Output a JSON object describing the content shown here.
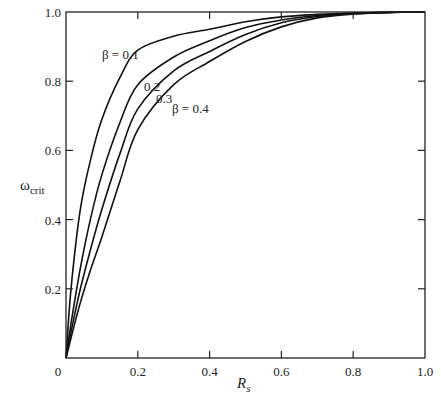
{
  "chart_data": {
    "type": "line",
    "title": "",
    "xlabel": "R_s",
    "ylabel": "ω_crit",
    "xlim": [
      0,
      1.0
    ],
    "ylim": [
      0,
      1.0
    ],
    "grid": false,
    "legend": "inline labels on curves",
    "x_ticks": [
      "0",
      "0.2",
      "0.4",
      "0.6",
      "0.8",
      "1.0"
    ],
    "y_ticks": [
      "0.2",
      "0.4",
      "0.6",
      "0.8",
      "1.0"
    ],
    "x": [
      0,
      0.014,
      0.04,
      0.07,
      0.1,
      0.15,
      0.2,
      0.3,
      0.4,
      0.5,
      0.6,
      0.7,
      0.8,
      0.9,
      1.0
    ],
    "series": [
      {
        "name": "β = 0.1",
        "label": "β = 0.1",
        "values": [
          0,
          0.2,
          0.43,
          0.58,
          0.69,
          0.81,
          0.89,
          0.93,
          0.95,
          0.972,
          0.986,
          0.993,
          0.997,
          0.999,
          1.0
        ]
      },
      {
        "name": "β = 0.2",
        "label": "0.2",
        "values": [
          0,
          0.1,
          0.26,
          0.41,
          0.53,
          0.68,
          0.79,
          0.87,
          0.917,
          0.955,
          0.977,
          0.99,
          0.996,
          0.999,
          1.0
        ]
      },
      {
        "name": "β = 0.3",
        "label": "0.3",
        "values": [
          0,
          0.075,
          0.2,
          0.32,
          0.43,
          0.59,
          0.72,
          0.83,
          0.886,
          0.935,
          0.969,
          0.987,
          0.995,
          0.999,
          1.0
        ]
      },
      {
        "name": "β = 0.4",
        "label": "β = 0.4",
        "values": [
          0,
          0.058,
          0.16,
          0.26,
          0.35,
          0.51,
          0.66,
          0.79,
          0.857,
          0.915,
          0.957,
          0.983,
          0.994,
          0.999,
          1.0
        ]
      }
    ]
  },
  "labels": {
    "y_axis_main": "ω",
    "y_axis_sub": "crit",
    "x_axis_main": "R",
    "x_axis_sub": "s",
    "origin": "0"
  }
}
